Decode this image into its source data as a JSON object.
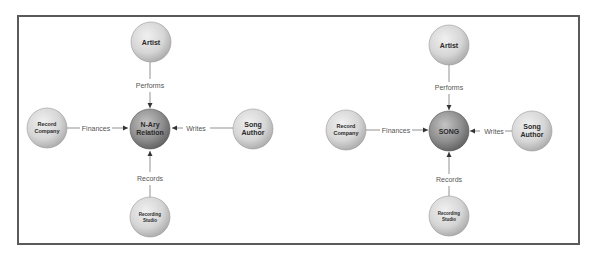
{
  "colors": {
    "frame": "#5a5a5a",
    "outer_node_fill": "#d4d4d4",
    "center_node_fill": "#8e8e8e",
    "edge": "#555555",
    "label": "#555555"
  },
  "diagrams": [
    {
      "center": {
        "label_lines": [
          "N-Ary",
          "Relation"
        ]
      },
      "nodes": {
        "top": {
          "label_lines": [
            "Artist"
          ]
        },
        "left": {
          "label_lines": [
            "Record",
            "Company"
          ]
        },
        "right": {
          "label_lines": [
            "Song",
            "Author"
          ]
        },
        "bottom": {
          "label_lines": [
            "Recording",
            "Studio"
          ]
        }
      },
      "edges": {
        "top": "Performs",
        "left": "Finances",
        "right": "Writes",
        "bottom": "Records"
      }
    },
    {
      "center": {
        "label_lines": [
          "SONG"
        ]
      },
      "nodes": {
        "top": {
          "label_lines": [
            "Artist"
          ]
        },
        "left": {
          "label_lines": [
            "Record",
            "Company"
          ]
        },
        "right": {
          "label_lines": [
            "Song",
            "Author"
          ]
        },
        "bottom": {
          "label_lines": [
            "Recording",
            "Studio"
          ]
        }
      },
      "edges": {
        "top": "Performs",
        "left": "Finances",
        "right": "Writes",
        "bottom": "Records"
      }
    }
  ]
}
